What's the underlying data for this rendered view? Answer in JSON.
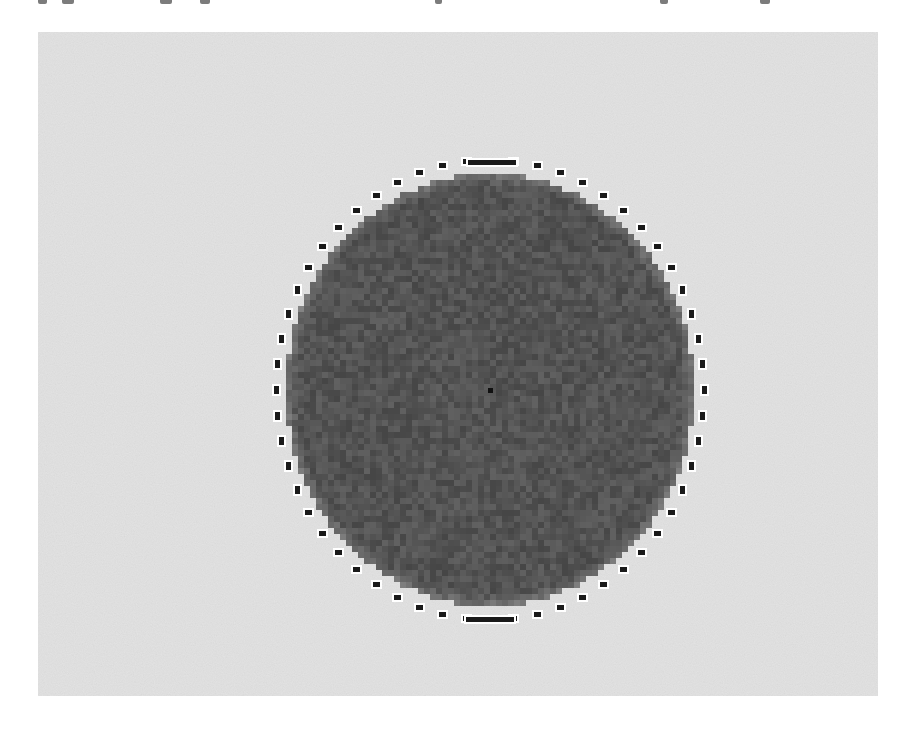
{
  "page": {
    "background": "#ffffff",
    "top_edge_text": {
      "description": "bottom fragments of cut-off text line at top edge (illegible)",
      "fragments_x": [
        38,
        62,
        160,
        200,
        435,
        660,
        760
      ]
    }
  },
  "figure": {
    "kind": "segmentation-image",
    "frame": {
      "x": 38,
      "y": 32,
      "width": 840,
      "height": 664,
      "fill": "#e3e3e3"
    },
    "object": {
      "shape": "disc",
      "center": [
        490,
        390
      ],
      "radius_x": 204,
      "radius_y": 216,
      "fill": "#4e4e4e",
      "texture": "pixelated noise",
      "pixel_size": 6
    },
    "center_marker": {
      "x": 490,
      "y": 390,
      "size": 5,
      "fill": "#111111"
    },
    "contour": {
      "style": "dotted rectangles",
      "color": "#1a1a1a",
      "halo": "#ffffff",
      "center": [
        490,
        390
      ],
      "radius_x": 214,
      "radius_y": 230,
      "count": 56,
      "top_bar": {
        "x": 468,
        "y": 160,
        "width": 48,
        "height": 5
      },
      "bottom_bar": {
        "x": 466,
        "y": 617,
        "width": 48,
        "height": 5
      }
    },
    "caption": ""
  }
}
